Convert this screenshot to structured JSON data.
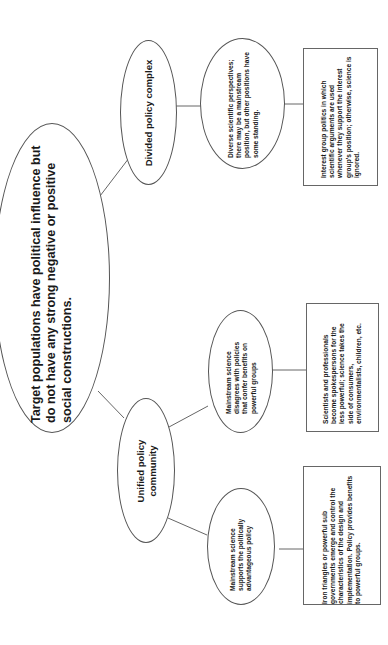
{
  "diagram": {
    "orientation": "rotated 90 degrees counter-clockwise",
    "root": {
      "text": "Target populations have political influence but do not have any strong negative or positive social constructions."
    },
    "branches": [
      {
        "label": "Divided policy complex",
        "children": [
          {
            "ellipse_text": "Diverse scientific perspectives; there may be a mainstream position, but other positions have some standing.",
            "outcome_text": "Interest group politics in which scientific arguments are used whenever they support the interest group's position; otherwise, science is ignored."
          }
        ]
      },
      {
        "label": "Unified policy community",
        "children": [
          {
            "ellipse_text": "Mainstream science disagrees with policies that confer benefits on powerful groups",
            "outcome_text": "Scientists and professionals become spokespersons for the less powerful; science takes the side of consumers, environmentalists, children, etc."
          },
          {
            "ellipse_text": "Mainstream science supports the politically advantageous policy",
            "outcome_text": "Iron triangles or powerful sub governments emerge and control the characteristics of the design and implementation.  Policy provides benefits to powerful groups."
          }
        ]
      }
    ],
    "colors": {
      "background": "#ffffff",
      "stroke": "#555555",
      "text": "#1a1a1a"
    }
  }
}
